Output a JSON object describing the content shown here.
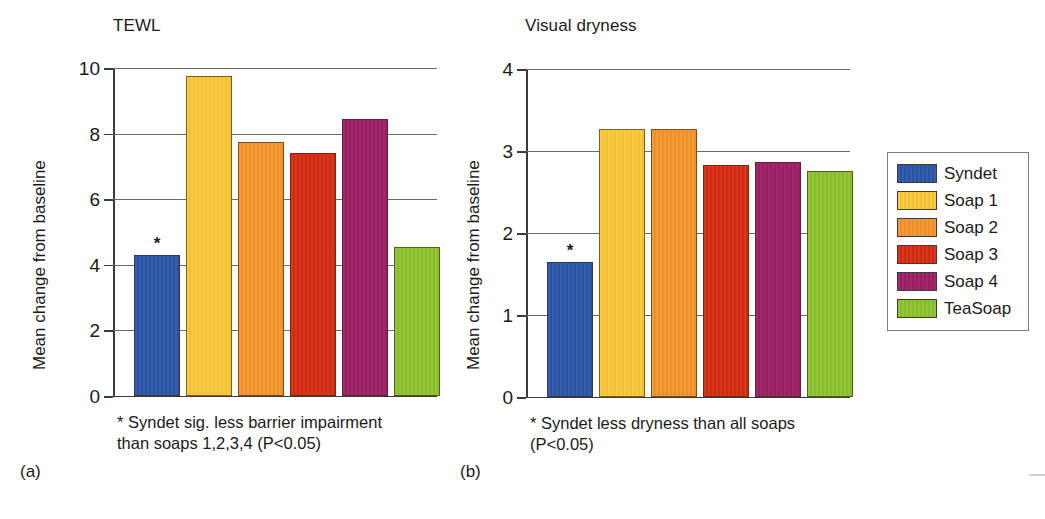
{
  "chart_data": [
    {
      "type": "bar",
      "panel": "(a)",
      "title": "TEWL",
      "ylabel": "Mean change from baseline",
      "xlabel": "",
      "categories": [
        "Syndet",
        "Soap 1",
        "Soap 2",
        "Soap 3",
        "Soap 4",
        "TeaSoap"
      ],
      "values": [
        4.3,
        9.75,
        7.75,
        7.4,
        8.45,
        4.55
      ],
      "ylim": [
        0,
        10
      ],
      "yticks": [
        0,
        2,
        4,
        6,
        8,
        10
      ],
      "ticklabels": [
        "0",
        "2",
        "4",
        "6",
        "8",
        "10"
      ],
      "grid": true,
      "legend_position": "right-outside",
      "annotations": [
        {
          "category": "Syndet",
          "marker": "*"
        }
      ],
      "footnote": "* Syndet sig. less barrier impairment\nthan soaps 1,2,3,4 (P<0.05)"
    },
    {
      "type": "bar",
      "panel": "(b)",
      "title": "Visual dryness",
      "ylabel": "Mean change from baseline",
      "xlabel": "",
      "categories": [
        "Syndet",
        "Soap 1",
        "Soap 2",
        "Soap 3",
        "Soap 4",
        "TeaSoap"
      ],
      "values": [
        1.65,
        3.27,
        3.27,
        2.83,
        2.87,
        2.76
      ],
      "ylim": [
        0,
        4
      ],
      "yticks": [
        0,
        1,
        2,
        3,
        4
      ],
      "ticklabels": [
        "0",
        "1",
        "2",
        "3",
        "4"
      ],
      "grid": true,
      "legend_position": "right-outside",
      "annotations": [
        {
          "category": "Syndet",
          "marker": "*"
        }
      ],
      "footnote": "* Syndet less dryness than all soaps\n(P<0.05)"
    }
  ],
  "legend": {
    "entries": [
      {
        "label": "Syndet",
        "color": "#2a56a8"
      },
      {
        "label": "Soap 1",
        "color": "#f9c838"
      },
      {
        "label": "Soap 2",
        "color": "#f5952c"
      },
      {
        "label": "Soap 3",
        "color": "#d62d12"
      },
      {
        "label": "Soap 4",
        "color": "#9d1f64"
      },
      {
        "label": "TeaSoap",
        "color": "#8cc22e"
      }
    ]
  },
  "panel_a": {
    "tag": "(a)",
    "title": "TEWL",
    "ylabel": "Mean change from baseline",
    "footnote": "* Syndet sig. less barrier impairment\nthan soaps 1,2,3,4 (P<0.05)",
    "star": "*",
    "ticklabels": {
      "t0": "0",
      "t1": "2",
      "t2": "4",
      "t3": "6",
      "t4": "8",
      "t5": "10"
    }
  },
  "panel_b": {
    "tag": "(b)",
    "title": "Visual dryness",
    "ylabel": "Mean change from baseline",
    "footnote": "* Syndet less dryness than all soaps\n(P<0.05)",
    "star": "*",
    "ticklabels": {
      "t0": "0",
      "t1": "1",
      "t2": "2",
      "t3": "3",
      "t4": "4"
    }
  }
}
